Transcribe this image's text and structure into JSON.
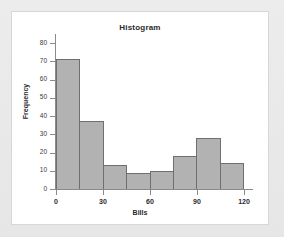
{
  "chart_data": {
    "type": "bar",
    "title": "Histogram",
    "xlabel": "Bills",
    "ylabel": "Frequency",
    "categories": [
      "0-15",
      "15-30",
      "30-45",
      "45-60",
      "60-75",
      "75-90",
      "90-105",
      "105-120"
    ],
    "bin_edges": [
      0,
      15,
      30,
      45,
      60,
      75,
      90,
      105,
      120
    ],
    "values": [
      71,
      37,
      13,
      9,
      10,
      18,
      28,
      14
    ],
    "xlim": [
      0,
      120
    ],
    "ylim": [
      0,
      80
    ],
    "xticks": [
      "0",
      "30",
      "60",
      "90",
      "120"
    ],
    "xtick_values": [
      0,
      30,
      60,
      90,
      120
    ],
    "yticks": [
      "0",
      "10",
      "20",
      "30",
      "40",
      "50",
      "60",
      "70",
      "80"
    ],
    "ytick_values": [
      0,
      10,
      20,
      30,
      40,
      50,
      60,
      70,
      80
    ],
    "grid": false,
    "legend": false,
    "bar_fill_color": "#b2b2b2",
    "bar_edge_color": "#6f6f6f",
    "axis_color": "#8a8a8a",
    "panel_background": "#ffffff",
    "page_background": "#e9e9e9"
  }
}
